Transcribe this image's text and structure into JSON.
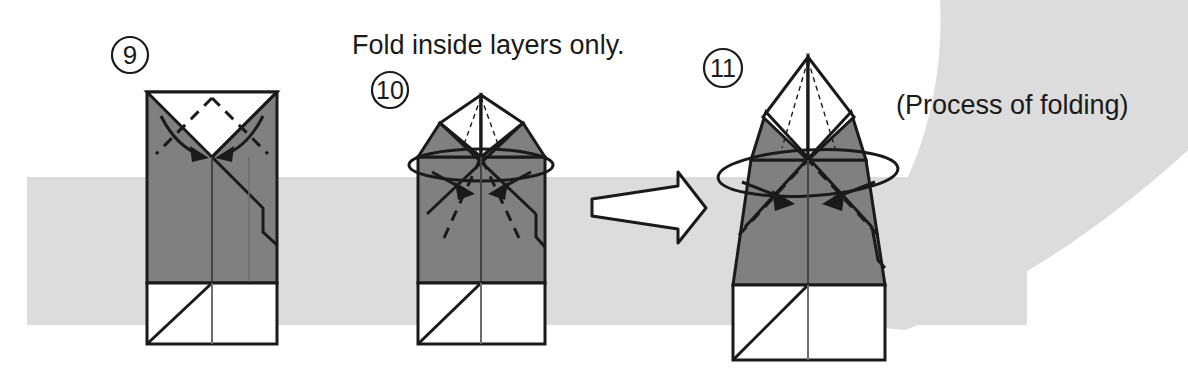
{
  "page": {
    "background_color": "#ffffff",
    "band_color": "#dcdcdc",
    "paper_gray": "#808080",
    "paper_white": "#ffffff",
    "ink_color": "#1a1a1a"
  },
  "captions": {
    "fold_instruction": "Fold inside layers only.",
    "process_note": "(Process of folding)"
  },
  "steps": [
    {
      "number": "9",
      "badge_label": "9",
      "badge_x": 130,
      "badge_y": 55,
      "figure_name": "step-9-figure",
      "description": "Tall rectangle, gray front with white V notch at top, diagonal crease, white band at bottom"
    },
    {
      "number": "10",
      "badge_label": "10",
      "badge_x": 390,
      "badge_y": 90,
      "figure_name": "step-10-figure",
      "description": "Peaked top with white inner triangles, rotation ellipse around body, white band at bottom"
    },
    {
      "number": "11",
      "badge_label": "11",
      "badge_x": 723,
      "badge_y": 68,
      "figure_name": "step-11-figure",
      "description": "Wider tapered body with tall white diamond peak, rotation ellipse, white band at bottom"
    }
  ],
  "arrow": {
    "name": "process-arrow",
    "direction": "right",
    "style": "white outlined block arrow"
  },
  "markers": {
    "valley_fold": "dashed line",
    "mountain_fold": "solid line",
    "motion_arrow": "solid filled arrowhead",
    "rotation": "ellipse"
  }
}
